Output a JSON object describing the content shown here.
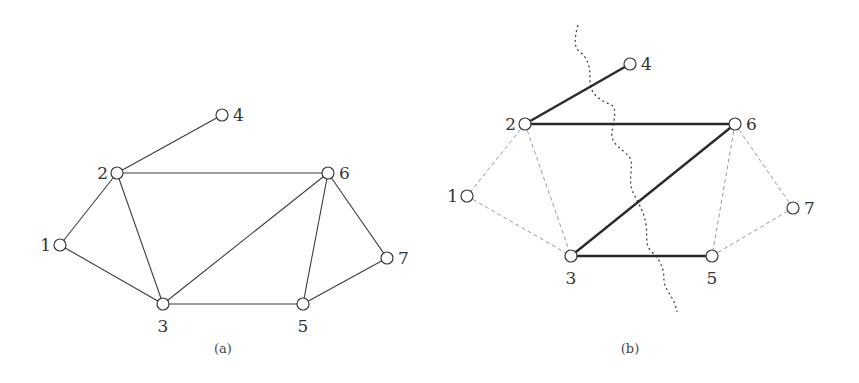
{
  "figure": {
    "panels": [
      {
        "id": "a",
        "caption": "(a)",
        "nodes": [
          {
            "id": "1",
            "label": "1",
            "x": 60,
            "y": 245,
            "label_side": "left"
          },
          {
            "id": "2",
            "label": "2",
            "x": 117,
            "y": 173,
            "label_side": "left"
          },
          {
            "id": "3",
            "label": "3",
            "x": 163,
            "y": 304,
            "label_side": "below"
          },
          {
            "id": "4",
            "label": "4",
            "x": 222,
            "y": 115,
            "label_side": "right"
          },
          {
            "id": "5",
            "label": "5",
            "x": 303,
            "y": 304,
            "label_side": "below"
          },
          {
            "id": "6",
            "label": "6",
            "x": 328,
            "y": 173,
            "label_side": "right"
          },
          {
            "id": "7",
            "label": "7",
            "x": 387,
            "y": 258,
            "label_side": "right"
          }
        ],
        "edges": [
          {
            "from": "2",
            "to": "4",
            "style": "solid"
          },
          {
            "from": "2",
            "to": "6",
            "style": "solid"
          },
          {
            "from": "2",
            "to": "1",
            "style": "solid"
          },
          {
            "from": "2",
            "to": "3",
            "style": "solid"
          },
          {
            "from": "1",
            "to": "3",
            "style": "solid"
          },
          {
            "from": "3",
            "to": "6",
            "style": "solid"
          },
          {
            "from": "3",
            "to": "5",
            "style": "solid"
          },
          {
            "from": "6",
            "to": "5",
            "style": "solid"
          },
          {
            "from": "6",
            "to": "7",
            "style": "solid"
          },
          {
            "from": "5",
            "to": "7",
            "style": "solid"
          }
        ]
      },
      {
        "id": "b",
        "caption": "(b)",
        "nodes": [
          {
            "id": "1",
            "label": "1",
            "x": 467,
            "y": 196,
            "label_side": "left"
          },
          {
            "id": "2",
            "label": "2",
            "x": 525,
            "y": 124,
            "label_side": "left"
          },
          {
            "id": "3",
            "label": "3",
            "x": 571,
            "y": 256,
            "label_side": "below"
          },
          {
            "id": "4",
            "label": "4",
            "x": 630,
            "y": 64,
            "label_side": "right"
          },
          {
            "id": "5",
            "label": "5",
            "x": 712,
            "y": 256,
            "label_side": "below"
          },
          {
            "id": "6",
            "label": "6",
            "x": 735,
            "y": 124,
            "label_side": "right"
          },
          {
            "id": "7",
            "label": "7",
            "x": 793,
            "y": 208,
            "label_side": "right"
          }
        ],
        "edges": [
          {
            "from": "2",
            "to": "4",
            "style": "thick"
          },
          {
            "from": "2",
            "to": "6",
            "style": "thick"
          },
          {
            "from": "6",
            "to": "3",
            "style": "thick"
          },
          {
            "from": "3",
            "to": "5",
            "style": "thick"
          },
          {
            "from": "2",
            "to": "1",
            "style": "dashed"
          },
          {
            "from": "2",
            "to": "3",
            "style": "dashed"
          },
          {
            "from": "1",
            "to": "3",
            "style": "dashed"
          },
          {
            "from": "6",
            "to": "5",
            "style": "dashed"
          },
          {
            "from": "6",
            "to": "7",
            "style": "dashed"
          },
          {
            "from": "5",
            "to": "7",
            "style": "dashed"
          }
        ],
        "cut_line": {
          "style": "dotted-wavy",
          "description": "cut separating {2,3} side from {4,6,5} side"
        }
      }
    ]
  }
}
